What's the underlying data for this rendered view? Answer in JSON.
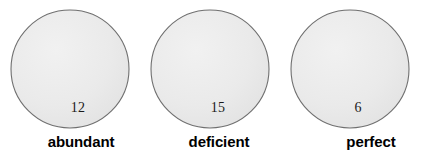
{
  "figure": {
    "background_color": "#ffffff",
    "circle_fill_color": "#e9e9e9",
    "circle_stroke_color": "#6f6f6f",
    "number_text_color": "#1a1a1a",
    "caption_text_color": "#000000"
  },
  "groups": [
    {
      "number": "12",
      "caption": "abundant",
      "circle_icon": "circle-outline-icon"
    },
    {
      "number": "15",
      "caption": "deficient",
      "circle_icon": "circle-outline-icon"
    },
    {
      "number": "6",
      "caption": "perfect",
      "circle_icon": "circle-outline-icon"
    }
  ]
}
